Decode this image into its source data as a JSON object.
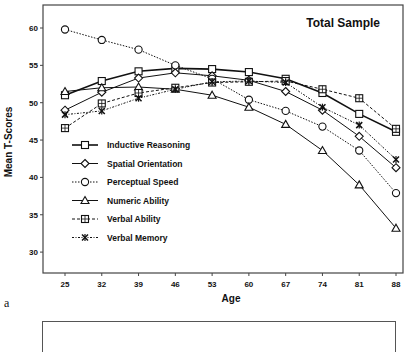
{
  "chart_data": {
    "type": "line",
    "title": "Total Sample",
    "xlabel": "Age",
    "ylabel": "Mean T-Scores",
    "x": [
      25,
      32,
      39,
      46,
      53,
      60,
      67,
      74,
      81,
      88
    ],
    "xticks": [
      "25",
      "32",
      "39",
      "46",
      "53",
      "60",
      "67",
      "74",
      "81",
      "88"
    ],
    "yticks": [
      "30",
      "35",
      "40",
      "45",
      "50",
      "55",
      "60"
    ],
    "ylim": [
      27,
      63
    ],
    "grid": false,
    "legend_position": "lower-left inside",
    "series": [
      {
        "name": "Inductive Reasoning",
        "marker": "square",
        "line": "solid-thick",
        "values": [
          51.0,
          52.9,
          54.2,
          54.6,
          54.5,
          54.1,
          53.2,
          51.3,
          48.5,
          46.1
        ]
      },
      {
        "name": "Spatial Orientation",
        "marker": "diamond",
        "line": "solid",
        "values": [
          49.0,
          51.4,
          53.3,
          54.0,
          53.6,
          53.0,
          51.5,
          49.0,
          45.5,
          41.3
        ]
      },
      {
        "name": "Perceptual Speed",
        "marker": "circle",
        "line": "dotted",
        "values": [
          59.8,
          58.4,
          57.1,
          55.0,
          53.2,
          50.4,
          48.9,
          46.8,
          43.6,
          37.9
        ]
      },
      {
        "name": "Numeric Ability",
        "marker": "triangle",
        "line": "solid",
        "values": [
          51.5,
          52.0,
          52.1,
          51.8,
          51.0,
          49.4,
          47.1,
          43.6,
          39.0,
          33.2
        ]
      },
      {
        "name": "Verbal Ability",
        "marker": "crossed-square",
        "line": "dashed",
        "values": [
          46.6,
          49.9,
          51.3,
          52.0,
          52.7,
          52.8,
          52.9,
          51.8,
          50.6,
          46.5
        ]
      },
      {
        "name": "Verbal Memory",
        "marker": "asterisk",
        "line": "dash-dot",
        "values": [
          48.4,
          48.9,
          50.6,
          51.8,
          52.8,
          52.9,
          52.7,
          49.4,
          47.0,
          42.4
        ]
      }
    ]
  },
  "panel_label": "a",
  "colors": {
    "ink": "#111111",
    "frame": "#444444",
    "background": "#ffffff"
  }
}
